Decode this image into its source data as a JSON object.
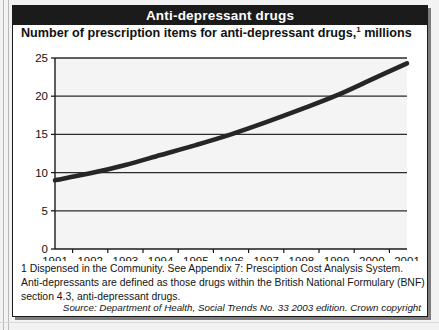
{
  "figure": {
    "title": "Anti-depressant drugs",
    "subtitle_prefix": "Number of prescription items for anti-depressant drugs,",
    "subtitle_superscript": "1",
    "subtitle_suffix": " millions",
    "footnotes": [
      "1 Dispensed in the Community. See Appendix 7: Presciption Cost Analysis System.",
      "Anti-depressants are defined as those drugs within the British National Formulary (BNF)",
      "section 4.3, anti-depressant drugs."
    ],
    "source": "Source: Department of Health, Social Trends No. 33 2003 edition. Crown copyright",
    "colors": {
      "title_bar_background": "#1b1b1b",
      "title_text": "#ffffff",
      "line": "#262626",
      "gridline": "#2b2b2b",
      "plot_background": "#f4f4f4",
      "page_background": "#f2f2f2",
      "figure_background": "#ffffff"
    }
  },
  "chart_data": {
    "type": "line",
    "xlabel": "",
    "ylabel": "millions",
    "categories": [
      "1991",
      "1992",
      "1993",
      "1994",
      "1995",
      "1996",
      "1997",
      "1998",
      "1999",
      "2000",
      "2001"
    ],
    "x": [
      1991,
      1992,
      1993,
      1994,
      1995,
      1996,
      1997,
      1998,
      1999,
      2000,
      2001
    ],
    "series": [
      {
        "name": "Prescription items for anti-depressant drugs",
        "values": [
          9.0,
          9.9,
          11.0,
          12.3,
          13.6,
          15.0,
          16.6,
          18.3,
          20.1,
          22.2,
          24.3
        ]
      }
    ],
    "ylim": [
      0,
      25
    ],
    "yticks": [
      0,
      5,
      10,
      15,
      20,
      25
    ],
    "ytick_labels": [
      "0",
      "5",
      "10",
      "15",
      "20",
      "25"
    ],
    "xlim": [
      1991,
      2001
    ],
    "grid": "horizontal",
    "legend": "none"
  }
}
